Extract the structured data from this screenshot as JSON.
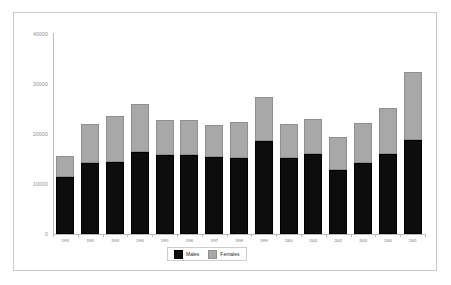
{
  "chart_data": {
    "type": "bar",
    "title": "",
    "subtitle": "",
    "xlabel": "",
    "ylabel": "",
    "stacked": true,
    "grid": false,
    "ylim": [
      0,
      40000
    ],
    "y_ticks": [
      "0",
      "10000",
      "20000",
      "30000",
      "40000"
    ],
    "y_tick_values": [
      0,
      10000,
      20000,
      30000,
      40000
    ],
    "legend_position": "bottom-center",
    "categories": [
      "1991",
      "1992",
      "1993",
      "1994",
      "1995",
      "1996",
      "1997",
      "1998",
      "1999",
      "2000",
      "2001",
      "2002",
      "2003",
      "2004",
      "2005"
    ],
    "series": [
      {
        "name": "Males",
        "color": "#0d0d0d",
        "values": [
          11400,
          14200,
          14500,
          16400,
          15800,
          15900,
          15500,
          15200,
          18600,
          15200,
          16000,
          12800,
          14300,
          16000,
          18800
        ]
      },
      {
        "name": "Females",
        "color": "#a8a8a8",
        "values": [
          4200,
          7800,
          9100,
          9700,
          7100,
          6900,
          6400,
          7200,
          8800,
          6800,
          7000,
          6600,
          7900,
          9300,
          13600
        ]
      }
    ],
    "totals": [
      15600,
      22000,
      23600,
      26100,
      22900,
      22800,
      21900,
      22400,
      27400,
      22000,
      23000,
      19400,
      22200,
      25300,
      32400
    ]
  },
  "legend": {
    "items": [
      {
        "label": "Males",
        "color": "#0d0d0d"
      },
      {
        "label": "Females",
        "color": "#a8a8a8"
      }
    ]
  },
  "colors": {
    "frame_border": "#c9c9c9",
    "axis": "#bdbdbd",
    "tick_text": "#8a8a8a",
    "background": "#ffffff"
  }
}
